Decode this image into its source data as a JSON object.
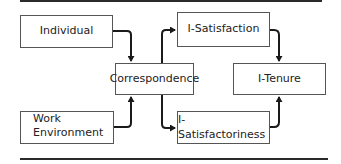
{
  "diagram": {
    "nodes": {
      "individual": "Individual",
      "work_environment_line1": "Work",
      "work_environment_line2": "Environment",
      "correspondence": "Correspondence",
      "i_satisfaction": "I-Satisfaction",
      "i_satisfactoriness": "I-Satisfactoriness",
      "i_tenure": "I-Tenure"
    },
    "edges": [
      {
        "from": "Individual",
        "to": "Correspondence"
      },
      {
        "from": "Work Environment",
        "to": "Correspondence"
      },
      {
        "from": "Correspondence",
        "to": "I-Satisfaction"
      },
      {
        "from": "Correspondence",
        "to": "I-Satisfactoriness"
      },
      {
        "from": "I-Satisfaction",
        "to": "I-Tenure"
      },
      {
        "from": "I-Satisfactoriness",
        "to": "I-Tenure"
      }
    ],
    "colors": {
      "line": "#1a1a1a",
      "box_border": "#555555",
      "text": "#222222"
    }
  }
}
